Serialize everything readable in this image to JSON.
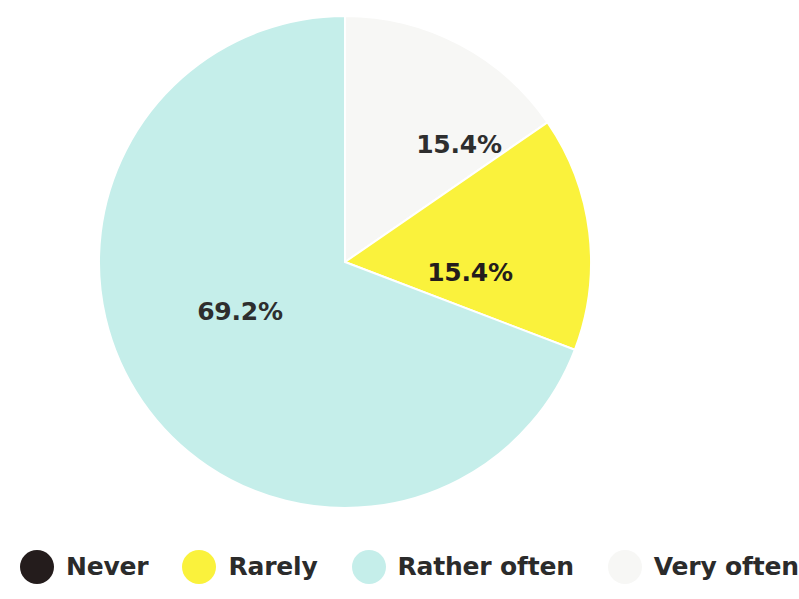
{
  "chart_data": {
    "type": "pie",
    "title": "",
    "subtitle": "",
    "xlabel": "",
    "ylabel": "",
    "grid": false,
    "legend_position": "bottom",
    "start_angle_deg": 0,
    "direction": "clockwise",
    "categories": [
      "Never",
      "Rarely",
      "Rather often",
      "Very often"
    ],
    "values": [
      0,
      15.4,
      69.2,
      15.4
    ],
    "value_unit": "%",
    "data_labels": [
      "",
      "15.4%",
      "69.2%",
      "15.4%"
    ],
    "colors": [
      "#241c1c",
      "#faf23c",
      "#c5eeea",
      "#f7f7f5"
    ],
    "slices": [
      {
        "name": "Never",
        "value": 0,
        "label": "",
        "color": "#241c1c",
        "start_deg": 0,
        "end_deg": 0,
        "rendered": false
      },
      {
        "name": "Very often",
        "value": 15.4,
        "label": "15.4%",
        "color": "#f7f7f5",
        "start_deg": 0,
        "end_deg": 55.4,
        "label_x": 459,
        "label_y": 144,
        "rendered": true
      },
      {
        "name": "Rarely",
        "value": 15.4,
        "label": "15.4%",
        "color": "#faf23c",
        "start_deg": 55.4,
        "end_deg": 110.9,
        "label_x": 470,
        "label_y": 272,
        "rendered": true
      },
      {
        "name": "Rather often",
        "value": 69.2,
        "label": "69.2%",
        "color": "#c5eeea",
        "start_deg": 110.9,
        "end_deg": 360,
        "label_x": 240,
        "label_y": 311,
        "rendered": true
      }
    ]
  },
  "pie": {
    "center_x": 345,
    "center_y": 262,
    "radius": 246,
    "labels": {
      "very_often": "15.4%",
      "rarely": "15.4%",
      "rather_often": "69.2%"
    }
  },
  "legend": {
    "items": [
      {
        "label": "Never",
        "color": "#241c1c"
      },
      {
        "label": "Rarely",
        "color": "#faf23c"
      },
      {
        "label": "Rather often",
        "color": "#c5eeea"
      },
      {
        "label": "Very often",
        "color": "#f7f7f5"
      }
    ]
  },
  "colors": {
    "background": "#ffffff",
    "never": "#241c1c",
    "rarely": "#faf23c",
    "rather_often": "#c5eeea",
    "very_often": "#f7f7f5",
    "label_text": "#2e2e2e",
    "legend_text": "#2b2b2b"
  }
}
